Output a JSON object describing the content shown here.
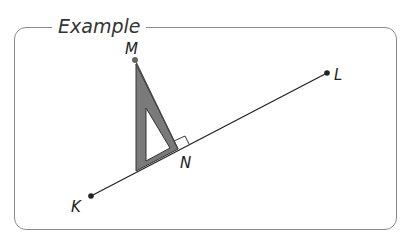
{
  "title": "Example",
  "points": {
    "K": {
      "label": "K",
      "x": 91,
      "y": 196
    },
    "L": {
      "label": "L",
      "x": 327,
      "y": 73
    },
    "M": {
      "label": "M",
      "x": 135,
      "y": 60
    },
    "N": {
      "label": "N",
      "x": 178,
      "y": 149
    }
  },
  "colors": {
    "frame": "#8a8a8a",
    "set_square_fill": "#7a7a7a",
    "line": "#222222"
  }
}
